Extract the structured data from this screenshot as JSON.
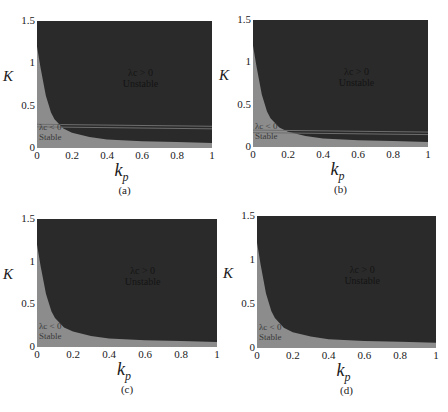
{
  "chart_data": [
    {
      "id": "a",
      "type": "area",
      "caption": "(a)",
      "xlabel": "k_p",
      "ylabel": "K",
      "xlim": [
        0,
        1
      ],
      "ylim": [
        0,
        1.5
      ],
      "xticks": [
        "0",
        "0.2",
        "0.4",
        "0.6",
        "0.8",
        "1"
      ],
      "yticks": [
        "0",
        "0.5",
        "1",
        "1.5"
      ],
      "regions": [
        {
          "name": "Unstable",
          "condition": "λc > 0",
          "color": "#2a2a2a"
        },
        {
          "name": "Stable",
          "condition": "λc < 0",
          "color": "#8c8c8c"
        }
      ],
      "boundary": {
        "x": [
          0,
          0.02,
          0.05,
          0.08,
          0.1,
          0.15,
          0.2,
          0.3,
          0.4,
          0.6,
          0.8,
          1.0
        ],
        "y": [
          1.2,
          0.95,
          0.62,
          0.42,
          0.34,
          0.23,
          0.18,
          0.13,
          0.1,
          0.08,
          0.07,
          0.06
        ]
      },
      "hlines": [
        0.28,
        0.25
      ],
      "grid": false
    },
    {
      "id": "b",
      "type": "area",
      "caption": "(b)",
      "xlabel": "k_p",
      "ylabel": "K",
      "xlim": [
        0,
        1
      ],
      "ylim": [
        0,
        1.5
      ],
      "xticks": [
        "0",
        "0.2",
        "0.4",
        "0.6",
        "0.8",
        "1"
      ],
      "yticks": [
        "0",
        "0.5",
        "1",
        "1.5"
      ],
      "regions": [
        {
          "name": "Unstable",
          "condition": "λc > 0",
          "color": "#2a2a2a"
        },
        {
          "name": "Stable",
          "condition": "λc < 0",
          "color": "#8c8c8c"
        }
      ],
      "boundary": {
        "x": [
          0,
          0.02,
          0.05,
          0.08,
          0.1,
          0.15,
          0.2,
          0.3,
          0.4,
          0.6,
          0.8,
          1.0
        ],
        "y": [
          1.2,
          0.95,
          0.62,
          0.42,
          0.34,
          0.23,
          0.18,
          0.13,
          0.1,
          0.08,
          0.07,
          0.06
        ]
      },
      "hlines": [
        0.2,
        0.17
      ],
      "grid": false
    },
    {
      "id": "c",
      "type": "area",
      "caption": "(c)",
      "xlabel": "k_p",
      "ylabel": "K",
      "xlim": [
        0,
        1
      ],
      "ylim": [
        0,
        1.5
      ],
      "xticks": [
        "0",
        "0.2",
        "0.4",
        "0.6",
        "0.8",
        "1"
      ],
      "yticks": [
        "0",
        "0.5",
        "1",
        "1.5"
      ],
      "regions": [
        {
          "name": "Unstable",
          "condition": "λc > 0",
          "color": "#2a2a2a"
        },
        {
          "name": "Stable",
          "condition": "λc < 0",
          "color": "#8c8c8c"
        }
      ],
      "boundary": {
        "x": [
          0,
          0.02,
          0.05,
          0.08,
          0.1,
          0.15,
          0.2,
          0.3,
          0.4,
          0.6,
          0.8,
          1.0
        ],
        "y": [
          1.2,
          0.95,
          0.62,
          0.42,
          0.34,
          0.23,
          0.18,
          0.13,
          0.1,
          0.08,
          0.07,
          0.06
        ]
      },
      "hlines": [],
      "grid": false
    },
    {
      "id": "d",
      "type": "area",
      "caption": "(d)",
      "xlabel": "k_p",
      "ylabel": "K",
      "xlim": [
        0,
        1
      ],
      "ylim": [
        0,
        1.5
      ],
      "xticks": [
        "0",
        "0.2",
        "0.4",
        "0.6",
        "0.8",
        "1"
      ],
      "yticks": [
        "0",
        "0.5",
        "1",
        "1.5"
      ],
      "regions": [
        {
          "name": "Unstable",
          "condition": "λc > 0",
          "color": "#2a2a2a"
        },
        {
          "name": "Stable",
          "condition": "λc < 0",
          "color": "#8c8c8c"
        }
      ],
      "boundary": {
        "x": [
          0,
          0.02,
          0.05,
          0.08,
          0.1,
          0.15,
          0.2,
          0.3,
          0.4,
          0.6,
          0.8,
          1.0
        ],
        "y": [
          1.2,
          0.95,
          0.62,
          0.42,
          0.34,
          0.23,
          0.18,
          0.13,
          0.1,
          0.08,
          0.07,
          0.06
        ]
      },
      "hlines": [],
      "grid": false
    }
  ],
  "labels": {
    "unstable_cond": "λc > 0",
    "unstable": "Unstable",
    "stable_cond": "λc < 0",
    "stable": "Stable",
    "xlabel_main": "k",
    "xlabel_sub": "p",
    "ylabel": "K"
  }
}
